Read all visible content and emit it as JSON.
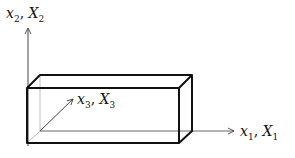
{
  "diagram": {
    "type": "3d-coordinate-axes-with-box",
    "axes": [
      {
        "id": "x1",
        "var": "x",
        "cap": "X",
        "sub": "1",
        "sep": ", ",
        "direction": "right"
      },
      {
        "id": "x2",
        "var": "x",
        "cap": "X",
        "sub": "2",
        "sep": ", ",
        "direction": "up"
      },
      {
        "id": "x3",
        "var": "x",
        "cap": "X",
        "sub": "3",
        "sep": ", ",
        "direction": "depth"
      }
    ],
    "box": {
      "front": {
        "left": 27,
        "top": 88,
        "right": 179,
        "bottom": 143
      },
      "back": {
        "left": 40,
        "top": 75,
        "right": 192,
        "bottom": 131
      }
    },
    "colors": {
      "edge": "#111111",
      "hidden_edge": "#bdbdbd",
      "axis": "#444444"
    }
  }
}
